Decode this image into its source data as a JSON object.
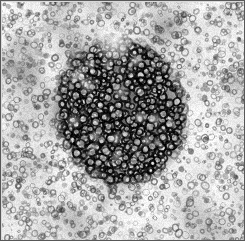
{
  "figure": {
    "kind": "electron-micrograph",
    "modality": "transmission electron microscopy, negative stain",
    "width_px": 245,
    "height_px": 247,
    "background_color": "#ffffff",
    "frame": {
      "border_color": "#585858",
      "border_width_px": 1,
      "inner_width_px": 243,
      "inner_height_px": 239
    },
    "bottom_strip": {
      "color": "#ffffff",
      "height_px": 6
    }
  },
  "image_content": {
    "description": "Dense roughly circular aggregate of small ring-shaped particles occupying the centre of a granular stained field",
    "tone_range": {
      "darkest": "#070707",
      "mid": "#8a8a8a",
      "lightest": "#fbfbfb"
    },
    "background_field": {
      "base_tone": "#e6e6e6",
      "granule_tone": "#4a4a4a",
      "granule_count": 2300,
      "granule_radius_px": [
        1.1,
        3.4
      ],
      "mottle_count": 150
    },
    "central_aggregate": {
      "center_x_px": 119,
      "center_y_px": 110,
      "radius_x_px": 64,
      "radius_y_px": 73,
      "rotation_deg": -12,
      "core_tone": "#101010",
      "particle_count": 900,
      "particle_radius_px": [
        2.0,
        4.6
      ],
      "bright_cap": {
        "x_px": 112,
        "y_px": 40,
        "radius_px": 22,
        "tone": "#f2f2f2"
      }
    },
    "noise": {
      "grain_amplitude": 26,
      "blur_px": 0.75,
      "seed": 20240517
    }
  },
  "labels": {
    "scale_bar_text": "",
    "annotation_text": ""
  }
}
